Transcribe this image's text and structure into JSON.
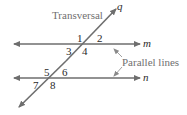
{
  "labels": {
    "transversal": "Transversal",
    "parallel_lines": "Parallel lines",
    "line_q": "q",
    "line_m": "m",
    "line_n": "n"
  },
  "angles": [
    "1",
    "2",
    "3",
    "4",
    "5",
    "6",
    "7",
    "8"
  ],
  "colors": {
    "line": "#6e6e6e",
    "text": "#2a2a2a",
    "annotation": "#707070",
    "background": "#ffffff"
  }
}
